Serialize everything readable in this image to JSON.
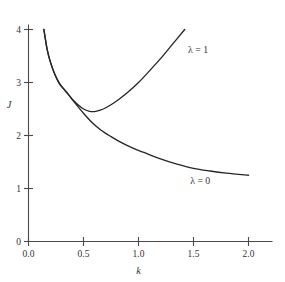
{
  "chart_data": {
    "type": "line",
    "title": "",
    "subtitle": "",
    "xlabel": "k",
    "ylabel": "J",
    "xlim": [
      0.0,
      2.0
    ],
    "ylim": [
      0,
      4
    ],
    "xticks": [
      "0.0",
      "0.5",
      "1.0",
      "1.5",
      "2.0"
    ],
    "xtick_values": [
      0.0,
      0.5,
      1.0,
      1.5,
      2.0
    ],
    "yticks": [
      "0",
      "1",
      "2",
      "3",
      "4"
    ],
    "ytick_values": [
      0,
      1,
      2,
      3,
      4
    ],
    "grid": false,
    "legend_position": "inline-annotation",
    "series": [
      {
        "name": "λ = 1",
        "label": "λ = 1",
        "label_x": 1.45,
        "label_y": 3.55,
        "color": "#262626",
        "x": [
          0.14,
          0.17,
          0.2,
          0.24,
          0.28,
          0.32,
          0.36,
          0.4,
          0.45,
          0.5,
          0.55,
          0.58,
          0.62,
          0.68,
          0.75,
          0.82,
          0.9,
          1.0,
          1.1,
          1.2,
          1.3,
          1.42
        ],
        "values": [
          4.0,
          3.62,
          3.38,
          3.15,
          2.98,
          2.88,
          2.78,
          2.68,
          2.58,
          2.5,
          2.46,
          2.45,
          2.46,
          2.5,
          2.58,
          2.68,
          2.81,
          3.0,
          3.22,
          3.45,
          3.7,
          4.0
        ]
      },
      {
        "name": "λ = 0",
        "label": "λ = 0",
        "label_x": 1.47,
        "label_y": 1.08,
        "color": "#262626",
        "x": [
          0.14,
          0.17,
          0.2,
          0.24,
          0.28,
          0.32,
          0.36,
          0.42,
          0.5,
          0.58,
          0.66,
          0.75,
          0.85,
          0.95,
          1.05,
          1.2,
          1.35,
          1.5,
          1.65,
          1.8,
          2.0
        ],
        "values": [
          4.0,
          3.62,
          3.38,
          3.15,
          2.99,
          2.88,
          2.78,
          2.62,
          2.42,
          2.24,
          2.1,
          1.98,
          1.86,
          1.76,
          1.68,
          1.56,
          1.46,
          1.38,
          1.33,
          1.29,
          1.25
        ]
      }
    ],
    "annotations": [
      {
        "text": "λ = 1",
        "x": 1.45,
        "y": 3.55
      },
      {
        "text": "λ = 0",
        "x": 1.47,
        "y": 1.08
      }
    ]
  },
  "axes": {
    "y_title": "J",
    "x_title": "k",
    "y_tick_labels": [
      "4",
      "3",
      "2",
      "1",
      "0"
    ],
    "x_tick_labels": [
      "0.0",
      "0.5",
      "1.0",
      "1.5",
      "2.0"
    ]
  },
  "colors": {
    "background": "#ffffff",
    "axis": "#4a4a4a",
    "curve": "#262626",
    "text": "#333333"
  }
}
